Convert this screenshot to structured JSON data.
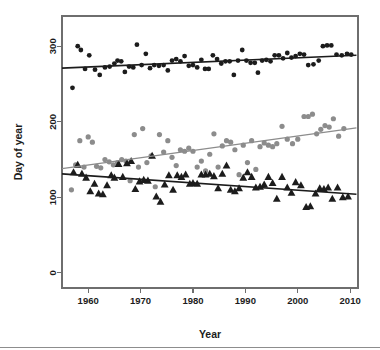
{
  "figure": {
    "background": "#ffffff",
    "frame_color": "#6e6e6e",
    "bottom_rule": true
  },
  "axis": {
    "x_title": "Year",
    "y_title": "Day of year",
    "x_ticks": [
      "1960",
      "1970",
      "1980",
      "1990",
      "2000",
      "2010"
    ],
    "y_ticks": [
      "0",
      "100",
      "200",
      "300"
    ]
  },
  "chart_data": {
    "type": "scatter",
    "title": "",
    "subtitle": "",
    "xlabel": "Year",
    "ylabel": "Day of year",
    "xlim": [
      1955.0,
      2011.5
    ],
    "ylim": [
      -20,
      340
    ],
    "xticks": [
      1960,
      1970,
      1980,
      1990,
      2000,
      2010
    ],
    "yticks": [
      0,
      100,
      200,
      300
    ],
    "grid": false,
    "legend": null,
    "legend_position": "none",
    "annotations": [],
    "series": [
      {
        "name": "last-frost-end / autumn event",
        "marker": "filled-circle",
        "color": "#1c1c1c",
        "size": 2.4,
        "trendline": {
          "color": "#1c1c1c",
          "width": 1.6,
          "x": [
            1955.0,
            2011.2
          ],
          "y": [
            271.0,
            288.0
          ]
        },
        "points": [
          {
            "x": 1957,
            "y": 245
          },
          {
            "x": 1958,
            "y": 300
          },
          {
            "x": 1958.6,
            "y": 295
          },
          {
            "x": 1959.4,
            "y": 270
          },
          {
            "x": 1960.2,
            "y": 288
          },
          {
            "x": 1961.3,
            "y": 269
          },
          {
            "x": 1962.2,
            "y": 262
          },
          {
            "x": 1963.2,
            "y": 272
          },
          {
            "x": 1964.1,
            "y": 273
          },
          {
            "x": 1965.0,
            "y": 277
          },
          {
            "x": 1965.6,
            "y": 281
          },
          {
            "x": 1966.3,
            "y": 280
          },
          {
            "x": 1967.0,
            "y": 266
          },
          {
            "x": 1967.8,
            "y": 273
          },
          {
            "x": 1968.6,
            "y": 272
          },
          {
            "x": 1969.3,
            "y": 302
          },
          {
            "x": 1970.2,
            "y": 275
          },
          {
            "x": 1971.0,
            "y": 290
          },
          {
            "x": 1971.8,
            "y": 271
          },
          {
            "x": 1972.6,
            "y": 275
          },
          {
            "x": 1973.5,
            "y": 274
          },
          {
            "x": 1974.4,
            "y": 275
          },
          {
            "x": 1975.2,
            "y": 268
          },
          {
            "x": 1976.0,
            "y": 281
          },
          {
            "x": 1976.8,
            "y": 283
          },
          {
            "x": 1977.6,
            "y": 280
          },
          {
            "x": 1978.4,
            "y": 287
          },
          {
            "x": 1979.2,
            "y": 274
          },
          {
            "x": 1980.0,
            "y": 275
          },
          {
            "x": 1980.8,
            "y": 272
          },
          {
            "x": 1981.6,
            "y": 282
          },
          {
            "x": 1982.3,
            "y": 270
          },
          {
            "x": 1983.0,
            "y": 270
          },
          {
            "x": 1983.8,
            "y": 288
          },
          {
            "x": 1984.6,
            "y": 283
          },
          {
            "x": 1985.4,
            "y": 277
          },
          {
            "x": 1986.2,
            "y": 280
          },
          {
            "x": 1987.0,
            "y": 280
          },
          {
            "x": 1987.8,
            "y": 262
          },
          {
            "x": 1988.6,
            "y": 281
          },
          {
            "x": 1989.4,
            "y": 295
          },
          {
            "x": 1990.2,
            "y": 281
          },
          {
            "x": 1991.0,
            "y": 278
          },
          {
            "x": 1991.8,
            "y": 278
          },
          {
            "x": 1992.4,
            "y": 265
          },
          {
            "x": 1993.2,
            "y": 281
          },
          {
            "x": 1994.0,
            "y": 282
          },
          {
            "x": 1994.8,
            "y": 280
          },
          {
            "x": 1995.6,
            "y": 288
          },
          {
            "x": 1996.4,
            "y": 288
          },
          {
            "x": 1997.2,
            "y": 284
          },
          {
            "x": 1998.0,
            "y": 291
          },
          {
            "x": 1998.8,
            "y": 285
          },
          {
            "x": 1999.6,
            "y": 287
          },
          {
            "x": 2000.4,
            "y": 290
          },
          {
            "x": 2001.2,
            "y": 289
          },
          {
            "x": 2002.0,
            "y": 275
          },
          {
            "x": 2003.0,
            "y": 276
          },
          {
            "x": 2004.0,
            "y": 281
          },
          {
            "x": 2004.8,
            "y": 300
          },
          {
            "x": 2005.6,
            "y": 301
          },
          {
            "x": 2006.4,
            "y": 301
          },
          {
            "x": 2007.4,
            "y": 289
          },
          {
            "x": 2008.4,
            "y": 288
          },
          {
            "x": 2009.4,
            "y": 290
          },
          {
            "x": 2010.2,
            "y": 289
          }
        ]
      },
      {
        "name": "mid-season event",
        "marker": "filled-circle",
        "color": "#8c8c8c",
        "size": 2.6,
        "trendline": {
          "color": "#8c8c8c",
          "width": 1.3,
          "x": [
            1955.0,
            2011.2
          ],
          "y": [
            138.0,
            192.0
          ]
        },
        "points": [
          {
            "x": 1956.8,
            "y": 110
          },
          {
            "x": 1957.6,
            "y": 143
          },
          {
            "x": 1958.4,
            "y": 175
          },
          {
            "x": 1959.2,
            "y": 140
          },
          {
            "x": 1960.0,
            "y": 180
          },
          {
            "x": 1960.8,
            "y": 173
          },
          {
            "x": 1961.6,
            "y": 141
          },
          {
            "x": 1962.4,
            "y": 139
          },
          {
            "x": 1963.2,
            "y": 150
          },
          {
            "x": 1964.0,
            "y": 147
          },
          {
            "x": 1964.8,
            "y": 143
          },
          {
            "x": 1965.6,
            "y": 146
          },
          {
            "x": 1966.4,
            "y": 150
          },
          {
            "x": 1967.2,
            "y": 148
          },
          {
            "x": 1968.0,
            "y": 122
          },
          {
            "x": 1968.8,
            "y": 183
          },
          {
            "x": 1969.6,
            "y": 140
          },
          {
            "x": 1970.4,
            "y": 191
          },
          {
            "x": 1971.2,
            "y": 146
          },
          {
            "x": 1972.0,
            "y": 155
          },
          {
            "x": 1972.8,
            "y": 114
          },
          {
            "x": 1973.6,
            "y": 183
          },
          {
            "x": 1974.4,
            "y": 160
          },
          {
            "x": 1975.2,
            "y": 175
          },
          {
            "x": 1976.0,
            "y": 153
          },
          {
            "x": 1976.8,
            "y": 142
          },
          {
            "x": 1977.6,
            "y": 163
          },
          {
            "x": 1978.4,
            "y": 161
          },
          {
            "x": 1979.2,
            "y": 165
          },
          {
            "x": 1980.0,
            "y": 161
          },
          {
            "x": 1980.8,
            "y": 140
          },
          {
            "x": 1981.6,
            "y": 148
          },
          {
            "x": 1982.4,
            "y": 135
          },
          {
            "x": 1983.2,
            "y": 157
          },
          {
            "x": 1984.0,
            "y": 184
          },
          {
            "x": 1984.8,
            "y": 140
          },
          {
            "x": 1985.6,
            "y": 168
          },
          {
            "x": 1986.4,
            "y": 175
          },
          {
            "x": 1987.2,
            "y": 173
          },
          {
            "x": 1988.0,
            "y": 163
          },
          {
            "x": 1988.8,
            "y": 130
          },
          {
            "x": 1989.6,
            "y": 169
          },
          {
            "x": 1990.4,
            "y": 146
          },
          {
            "x": 1991.2,
            "y": 175
          },
          {
            "x": 1992.0,
            "y": 137
          },
          {
            "x": 1992.8,
            "y": 167
          },
          {
            "x": 1993.6,
            "y": 172
          },
          {
            "x": 1994.4,
            "y": 169
          },
          {
            "x": 1995.2,
            "y": 167
          },
          {
            "x": 1996.0,
            "y": 171
          },
          {
            "x": 1997.0,
            "y": 194
          },
          {
            "x": 1998.0,
            "y": 177
          },
          {
            "x": 1999.0,
            "y": 171
          },
          {
            "x": 2000.0,
            "y": 177
          },
          {
            "x": 2001.2,
            "y": 207
          },
          {
            "x": 2002.0,
            "y": 207
          },
          {
            "x": 2002.8,
            "y": 210
          },
          {
            "x": 2003.6,
            "y": 184
          },
          {
            "x": 2004.4,
            "y": 190
          },
          {
            "x": 2005.2,
            "y": 195
          },
          {
            "x": 2006.0,
            "y": 193
          },
          {
            "x": 2006.8,
            "y": 204
          },
          {
            "x": 2007.8,
            "y": 181
          },
          {
            "x": 2008.8,
            "y": 191
          }
        ]
      },
      {
        "name": "spring event",
        "marker": "filled-triangle",
        "color": "#1c1c1c",
        "size": 3.2,
        "trendline": {
          "color": "#1c1c1c",
          "width": 1.6,
          "x": [
            1955.0,
            2011.2
          ],
          "y": [
            131.0,
            104.0
          ]
        },
        "points": [
          {
            "x": 1957.2,
            "y": 133
          },
          {
            "x": 1958.0,
            "y": 143
          },
          {
            "x": 1958.8,
            "y": 131
          },
          {
            "x": 1959.6,
            "y": 126
          },
          {
            "x": 1960.4,
            "y": 108
          },
          {
            "x": 1961.2,
            "y": 118
          },
          {
            "x": 1962.0,
            "y": 105
          },
          {
            "x": 1962.8,
            "y": 104
          },
          {
            "x": 1963.6,
            "y": 116
          },
          {
            "x": 1964.4,
            "y": 129
          },
          {
            "x": 1965.0,
            "y": 126
          },
          {
            "x": 1965.8,
            "y": 144
          },
          {
            "x": 1966.6,
            "y": 127
          },
          {
            "x": 1967.4,
            "y": 145
          },
          {
            "x": 1968.2,
            "y": 148
          },
          {
            "x": 1969.0,
            "y": 111
          },
          {
            "x": 1969.8,
            "y": 121
          },
          {
            "x": 1970.6,
            "y": 123
          },
          {
            "x": 1971.4,
            "y": 122
          },
          {
            "x": 1972.2,
            "y": 155
          },
          {
            "x": 1973.0,
            "y": 101
          },
          {
            "x": 1973.8,
            "y": 94
          },
          {
            "x": 1974.6,
            "y": 117
          },
          {
            "x": 1975.4,
            "y": 129
          },
          {
            "x": 1976.2,
            "y": 110
          },
          {
            "x": 1977.0,
            "y": 129
          },
          {
            "x": 1977.8,
            "y": 127
          },
          {
            "x": 1978.6,
            "y": 130
          },
          {
            "x": 1979.4,
            "y": 118
          },
          {
            "x": 1980.0,
            "y": 119
          },
          {
            "x": 1980.8,
            "y": 118
          },
          {
            "x": 1981.6,
            "y": 130
          },
          {
            "x": 1982.4,
            "y": 130
          },
          {
            "x": 1983.2,
            "y": 131
          },
          {
            "x": 1984.0,
            "y": 128
          },
          {
            "x": 1984.8,
            "y": 112
          },
          {
            "x": 1985.6,
            "y": 131
          },
          {
            "x": 1986.4,
            "y": 142
          },
          {
            "x": 1987.2,
            "y": 110
          },
          {
            "x": 1988.0,
            "y": 108
          },
          {
            "x": 1988.8,
            "y": 112
          },
          {
            "x": 1989.6,
            "y": 126
          },
          {
            "x": 1990.4,
            "y": 133
          },
          {
            "x": 1991.2,
            "y": 127
          },
          {
            "x": 1992.0,
            "y": 113
          },
          {
            "x": 1992.8,
            "y": 114
          },
          {
            "x": 1993.6,
            "y": 117
          },
          {
            "x": 1994.4,
            "y": 127
          },
          {
            "x": 1995.2,
            "y": 119
          },
          {
            "x": 1996.0,
            "y": 98
          },
          {
            "x": 1997.0,
            "y": 127
          },
          {
            "x": 1998.0,
            "y": 113
          },
          {
            "x": 1998.8,
            "y": 106
          },
          {
            "x": 1999.6,
            "y": 120
          },
          {
            "x": 2000.6,
            "y": 116
          },
          {
            "x": 2001.6,
            "y": 87
          },
          {
            "x": 2002.4,
            "y": 88
          },
          {
            "x": 2003.4,
            "y": 105
          },
          {
            "x": 2004.2,
            "y": 112
          },
          {
            "x": 2005.0,
            "y": 111
          },
          {
            "x": 2005.8,
            "y": 113
          },
          {
            "x": 2006.6,
            "y": 98
          },
          {
            "x": 2007.6,
            "y": 113
          },
          {
            "x": 2008.6,
            "y": 100
          },
          {
            "x": 2009.6,
            "y": 101
          }
        ]
      }
    ]
  }
}
